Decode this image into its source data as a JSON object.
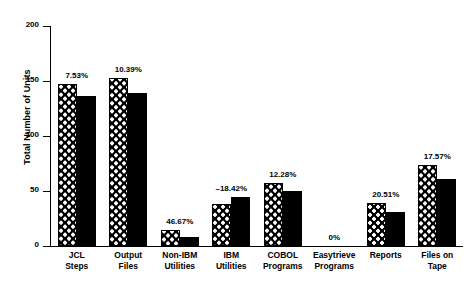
{
  "chart_data": {
    "type": "bar",
    "title": "",
    "xlabel": "",
    "ylabel": "Total Number of Units",
    "ylim": [
      0,
      200
    ],
    "yticks": [
      0,
      50,
      100,
      150,
      200
    ],
    "grid": false,
    "legend_position": "none",
    "categories": [
      "JCL Steps",
      "Output Files",
      "Non-IBM Utilities",
      "IBM Utilities",
      "COBOL Programs",
      "Easytrieve Programs",
      "Reports",
      "Files on Tape"
    ],
    "category_lines": [
      [
        "JCL",
        "Steps"
      ],
      [
        "Output",
        "Files"
      ],
      [
        "Non-IBM",
        "Utilities"
      ],
      [
        "IBM",
        "Utilities"
      ],
      [
        "COBOL",
        "Programs"
      ],
      [
        "Easytrieve",
        "Programs"
      ],
      [
        "Reports",
        ""
      ],
      [
        "Files on",
        "Tape"
      ]
    ],
    "series": [
      {
        "name": "Before",
        "pattern": "checkered",
        "color": "#000000",
        "values": [
          147,
          153,
          15,
          38,
          57,
          0,
          39,
          74
        ]
      },
      {
        "name": "After",
        "pattern": "solid",
        "color": "#000000",
        "values": [
          136,
          139,
          8,
          45,
          50,
          0,
          31,
          61
        ]
      }
    ],
    "annotations": [
      "7.53%",
      "10.39%",
      "46.67%",
      "–18.42%",
      "12.28%",
      "0%",
      "20.51%",
      "17.57%"
    ]
  },
  "axis": {
    "ytick_labels": [
      "0",
      "50",
      "100",
      "150",
      "200"
    ]
  }
}
